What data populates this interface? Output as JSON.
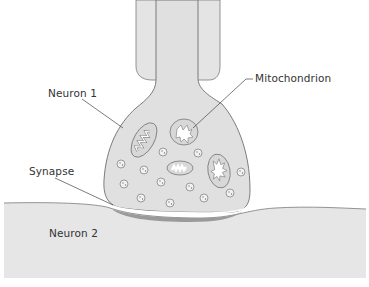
{
  "diagram": {
    "type": "synapse-illustration",
    "labels": {
      "neuron1": "Neuron 1",
      "neuron2": "Neuron 2",
      "synapse": "Synapse",
      "mitochondrion": "Mitochondrion"
    },
    "colors": {
      "cell_fill": "#e2e2e2",
      "neuron2_fill": "#e6e6e6",
      "outline": "#6e6e6e",
      "synaptic_density": "#9a9a9a",
      "label_text": "#333333",
      "leader_line": "#444444"
    }
  }
}
